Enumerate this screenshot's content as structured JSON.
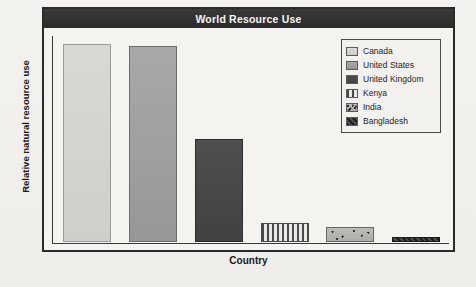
{
  "figure": {
    "title": "World Resource Use",
    "title_bar_color": "#2b2b2b",
    "frame_color": "#2a2a2a",
    "paper_color": "#f0efec"
  },
  "axes": {
    "y_label": "Relative natural resource use",
    "x_label": "Country"
  },
  "legend": {
    "items": [
      {
        "label": "Canada",
        "swatch": "light-gray-solid"
      },
      {
        "label": "United States",
        "swatch": "medium-gray-solid"
      },
      {
        "label": "United Kingdom",
        "swatch": "dark-gray-solid"
      },
      {
        "label": "Kenya",
        "swatch": "vertical-stripes"
      },
      {
        "label": "India",
        "swatch": "speckled-gray"
      },
      {
        "label": "Bangladesh",
        "swatch": "dark-hatch"
      }
    ]
  },
  "chart_data": {
    "type": "bar",
    "title": "World Resource Use",
    "xlabel": "Country",
    "ylabel": "Relative natural resource use",
    "categories": [
      "Canada",
      "United States",
      "United Kingdom",
      "Kenya",
      "India",
      "Bangladesh"
    ],
    "values": [
      96,
      95,
      50,
      9,
      7,
      2
    ],
    "ylim": [
      0,
      100
    ],
    "grid": false,
    "legend_position": "top-right",
    "tick_labels_shown": false,
    "note": "Y axis is unlabeled/relative; values estimated from bar pixel heights as percent of plot height."
  }
}
